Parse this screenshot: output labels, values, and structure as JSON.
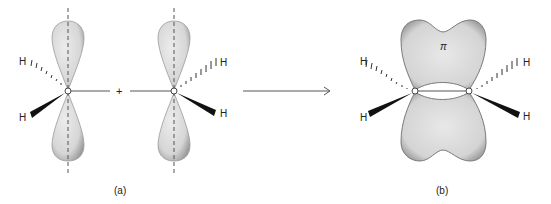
{
  "figure": {
    "panel_a": {
      "label": "(a)",
      "plus_sign": "+",
      "atoms": {
        "c1": "C",
        "c2": "C",
        "h_left_top": "H",
        "h_left_bottom": "H",
        "h_right_top": "H",
        "h_right_bottom": "H"
      }
    },
    "panel_b": {
      "label": "(b)",
      "orbital_label": "π",
      "atoms": {
        "c1": "C",
        "c2": "C",
        "h_left_top": "H",
        "h_left_bottom": "H",
        "h_right_top": "H",
        "h_right_bottom": "H"
      }
    },
    "colors": {
      "lobe_fill": "#dcdcdc",
      "lobe_edge": "#8a8a8a",
      "line": "#444444",
      "wedge": "#111111"
    }
  }
}
